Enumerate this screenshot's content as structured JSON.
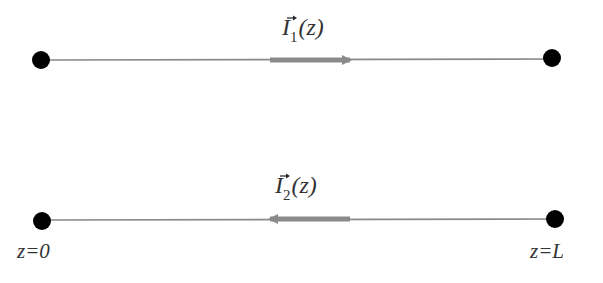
{
  "diagram": {
    "type": "two-wire current diagram",
    "wires": [
      {
        "id": "wire-1",
        "current_label": {
          "symbol": "I",
          "subscript": "1",
          "argument": "(z)",
          "vector": true
        },
        "direction": "positive-z",
        "y": 60,
        "x_start": 41,
        "x_end": 552,
        "arrow": {
          "from_x": 270,
          "to_x": 357
        }
      },
      {
        "id": "wire-2",
        "current_label": {
          "symbol": "I",
          "subscript": "2",
          "argument": "(z)",
          "vector": true
        },
        "direction": "negative-z",
        "y": 220,
        "x_start": 42,
        "x_end": 555,
        "arrow": {
          "from_x": 350,
          "to_x": 263
        }
      }
    ],
    "endpoint_labels": {
      "left": "z=0",
      "right": "z=L"
    },
    "colors": {
      "wire": "#888888",
      "arrow": "#8a8a8a",
      "dot": "#000000",
      "text": "#222222"
    }
  }
}
